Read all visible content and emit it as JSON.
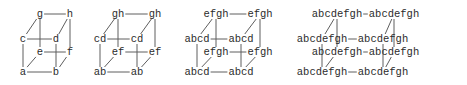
{
  "figure": {
    "background_color": "#ffffff",
    "text_color": "#2b2b2b",
    "line_color": "#5e5e5e",
    "cubes": [
      {
        "labels": {
          "back_top_left": "g",
          "back_top_right": "h",
          "front_top_left": "c",
          "front_top_right": "d",
          "back_bottom_left": "e",
          "back_bottom_right": "f",
          "front_bottom_left": "a",
          "front_bottom_right": "b"
        }
      },
      {
        "labels": {
          "back_top_left": "gh",
          "back_top_right": "gh",
          "front_top_left": "cd",
          "front_top_right": "cd",
          "back_bottom_left": "ef",
          "back_bottom_right": "ef",
          "front_bottom_left": "ab",
          "front_bottom_right": "ab"
        }
      },
      {
        "labels": {
          "back_top_left": "efgh",
          "back_top_right": "efgh",
          "front_top_left": "abcd",
          "front_top_right": "abcd",
          "back_bottom_left": "efgh",
          "back_bottom_right": "efgh",
          "front_bottom_left": "abcd",
          "front_bottom_right": "abcd"
        }
      },
      {
        "labels": {
          "back_top_left": "abcdefgh",
          "back_top_right": "abcdefgh",
          "front_top_left": "abcdefgh",
          "front_top_right": "abcdefgh",
          "back_bottom_left": "abcdefgh",
          "back_bottom_right": "abcdefgh",
          "front_bottom_left": "abcdefgh",
          "front_bottom_right": "abcdefgh"
        }
      }
    ]
  }
}
